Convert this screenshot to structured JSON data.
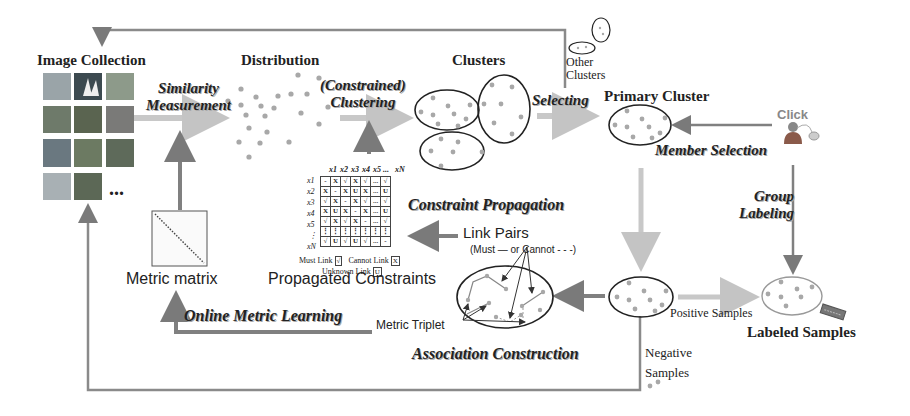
{
  "stages": {
    "image_collection": "Image Collection",
    "distribution": "Distribution",
    "clusters": "Clusters",
    "other_clusters_line1": "Other",
    "other_clusters_line2": "Clusters",
    "primary_cluster": "Primary Cluster",
    "click": "Click",
    "metric_matrix": "Metric matrix",
    "propagated_constraints": "Propagated Constraints",
    "labeled_samples": "Labeled Samples",
    "ellipsis": "..."
  },
  "steps": {
    "similarity_line1": "Similarity",
    "similarity_line2": "Measurement",
    "clustering_line1": "(Constrained)",
    "clustering_line2": "Clustering",
    "selecting": "Selecting",
    "member_selection": "Member Selection",
    "group_labeling_line1": "Group",
    "group_labeling_line2": "Labeling",
    "constraint_propagation": "Constraint Propagation",
    "online_metric_learning": "Online Metric Learning",
    "association_construction": "Association Construction"
  },
  "labels": {
    "link_pairs": "Link Pairs",
    "link_pairs_sub": "(Must — or Cannot - - -)",
    "metric_triplet": "Metric Triplet",
    "positive_samples": "Positive Samples",
    "negative_line1": "Negative",
    "negative_line2": "Samples"
  },
  "constraint_matrix": {
    "col_headers": [
      "x1",
      "x2",
      "x3",
      "x4",
      "x5",
      "...",
      "xN"
    ],
    "row_headers": [
      "x1",
      "x2",
      "x3",
      "x4",
      "x5",
      "⋮",
      "xN"
    ],
    "rows": [
      [
        "-",
        "X",
        "√",
        "X",
        "√",
        "...",
        "√"
      ],
      [
        "X",
        "-",
        "X",
        "U",
        "X",
        "...",
        "U"
      ],
      [
        "√",
        "X",
        "-",
        "X",
        "√",
        "...",
        "√"
      ],
      [
        "X",
        "U",
        "X",
        "-",
        "X",
        "...",
        "U"
      ],
      [
        "√",
        "X",
        "√",
        "X",
        "-",
        "...",
        "√"
      ],
      [
        "⋮",
        "⋮",
        "⋮",
        "⋮",
        "⋮",
        "⋮",
        "⋮"
      ],
      [
        "√",
        "U",
        "√",
        "U",
        "√",
        "...",
        "-"
      ]
    ],
    "legend_must": "Must Link",
    "legend_must_symbol": "√",
    "legend_cannot": "Cannot Link",
    "legend_cannot_symbol": "X",
    "legend_unknown": "Unknown Link",
    "legend_unknown_symbol": "U"
  },
  "colors": {
    "arrow_dark": "#808080",
    "arrow_light": "#c8c8c8",
    "dot": "#a0a0a0",
    "ellipse": "#222222"
  }
}
